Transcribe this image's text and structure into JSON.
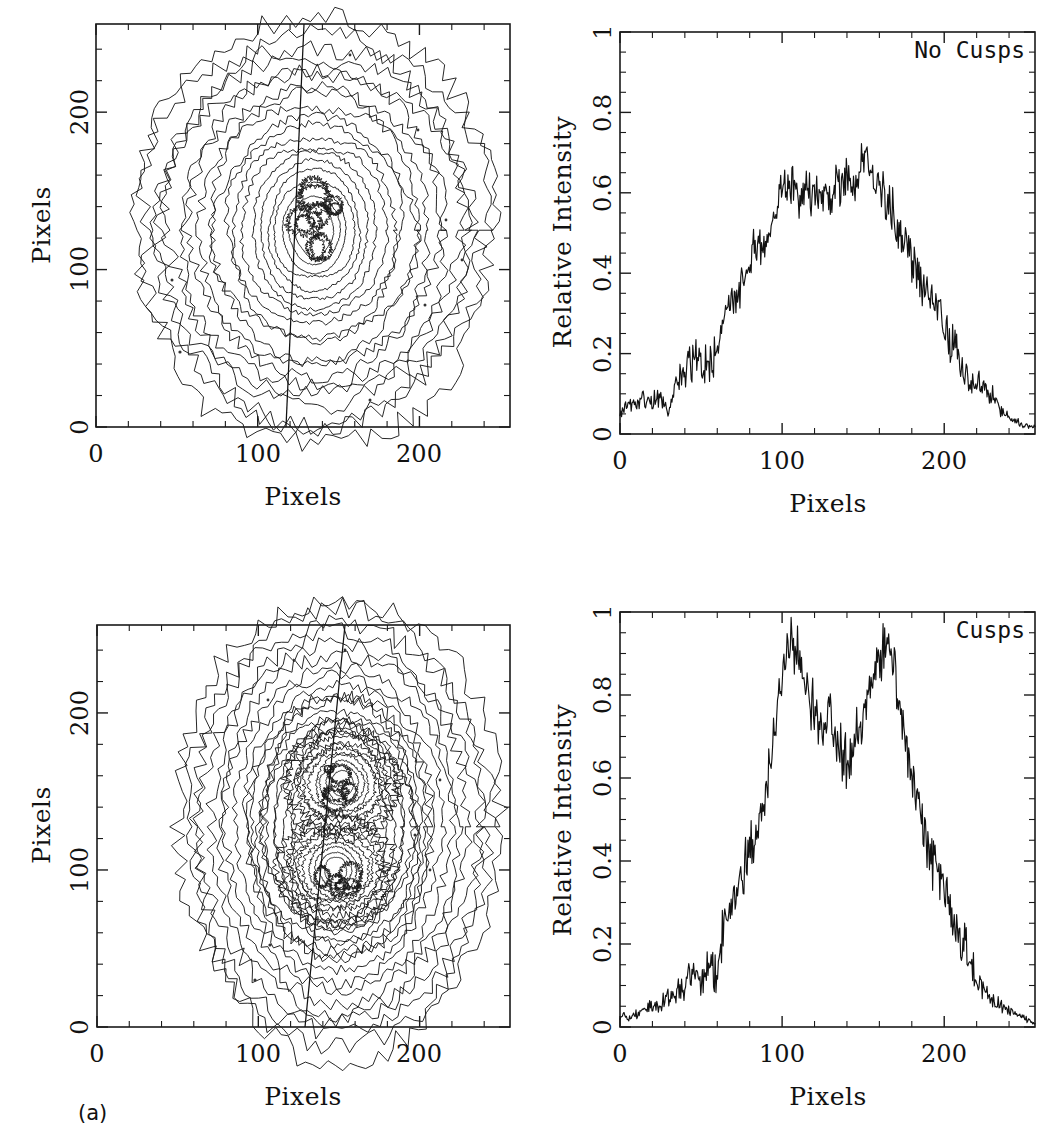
{
  "figure": {
    "panel_label": "(a)",
    "background_color": "#ffffff",
    "line_color": "#111111"
  },
  "panels": {
    "top_left": {
      "name": "contour-no-cusps",
      "xlabel": "Pixels",
      "ylabel": "Pixels",
      "xticks": [
        "0",
        "100",
        "200"
      ],
      "yticks": [
        "0",
        "100",
        "200"
      ],
      "xlim": [
        0,
        256
      ],
      "ylim": [
        0,
        256
      ],
      "annotation": ""
    },
    "top_right": {
      "name": "profile-no-cusps",
      "xlabel": "Pixels",
      "ylabel": "Relative Intensity",
      "xticks": [
        "0",
        "100",
        "200"
      ],
      "yticks": [
        "0",
        "0.2",
        "0.4",
        "0.6",
        "0.8",
        "1"
      ],
      "xlim": [
        0,
        256
      ],
      "ylim": [
        0,
        1
      ],
      "annotation": "No Cusps"
    },
    "bottom_left": {
      "name": "contour-cusps",
      "xlabel": "Pixels",
      "ylabel": "Pixels",
      "xticks": [
        "0",
        "100",
        "200"
      ],
      "yticks": [
        "0",
        "100",
        "200"
      ],
      "xlim": [
        0,
        256
      ],
      "ylim": [
        0,
        256
      ],
      "annotation": ""
    },
    "bottom_right": {
      "name": "profile-cusps",
      "xlabel": "Pixels",
      "ylabel": "Relative Intensity",
      "xticks": [
        "0",
        "100",
        "200"
      ],
      "yticks": [
        "0",
        "0.2",
        "0.4",
        "0.6",
        "0.8",
        "1"
      ],
      "xlim": [
        0,
        256
      ],
      "ylim": [
        0,
        1
      ],
      "annotation": "Cusps"
    }
  },
  "chart_data": [
    {
      "type": "line",
      "name": "no-cusps-profile",
      "title": "No Cusps",
      "xlabel": "Pixels",
      "ylabel": "Relative Intensity",
      "xlim": [
        0,
        256
      ],
      "ylim": [
        0,
        1
      ],
      "grid": false,
      "x": [
        0,
        5,
        10,
        15,
        20,
        25,
        30,
        35,
        40,
        45,
        50,
        55,
        60,
        65,
        70,
        75,
        80,
        85,
        90,
        95,
        100,
        105,
        110,
        115,
        120,
        125,
        130,
        135,
        140,
        145,
        150,
        155,
        160,
        165,
        170,
        175,
        180,
        185,
        190,
        195,
        200,
        205,
        210,
        215,
        220,
        225,
        230,
        235,
        240,
        245,
        250,
        255
      ],
      "values": [
        0.06,
        0.07,
        0.08,
        0.09,
        0.08,
        0.09,
        0.05,
        0.14,
        0.16,
        0.18,
        0.19,
        0.17,
        0.22,
        0.3,
        0.33,
        0.38,
        0.44,
        0.47,
        0.46,
        0.55,
        0.6,
        0.63,
        0.58,
        0.61,
        0.6,
        0.57,
        0.59,
        0.62,
        0.63,
        0.6,
        0.68,
        0.64,
        0.62,
        0.58,
        0.53,
        0.47,
        0.44,
        0.39,
        0.35,
        0.31,
        0.28,
        0.22,
        0.18,
        0.15,
        0.13,
        0.11,
        0.09,
        0.06,
        0.04,
        0.03,
        0.02,
        0.02
      ],
      "noise_amplitude": 0.045,
      "peak_value": 0.73,
      "peak_x": 150,
      "description": "Single broad noisy plateau near 0.60 between x=90 and x=170"
    },
    {
      "type": "line",
      "name": "cusps-profile",
      "title": "Cusps",
      "xlabel": "Pixels",
      "ylabel": "Relative Intensity",
      "xlim": [
        0,
        256
      ],
      "ylim": [
        0,
        1
      ],
      "grid": false,
      "x": [
        0,
        5,
        10,
        15,
        20,
        25,
        30,
        35,
        40,
        45,
        50,
        55,
        60,
        65,
        70,
        75,
        80,
        85,
        90,
        95,
        100,
        105,
        110,
        115,
        120,
        125,
        130,
        135,
        140,
        145,
        150,
        155,
        160,
        165,
        170,
        175,
        180,
        185,
        190,
        195,
        200,
        205,
        210,
        215,
        220,
        225,
        230,
        235,
        240,
        245,
        250,
        255
      ],
      "values": [
        0.03,
        0.02,
        0.03,
        0.04,
        0.05,
        0.06,
        0.07,
        0.08,
        0.1,
        0.13,
        0.11,
        0.14,
        0.13,
        0.28,
        0.3,
        0.36,
        0.42,
        0.48,
        0.58,
        0.72,
        0.85,
        0.95,
        0.9,
        0.82,
        0.76,
        0.72,
        0.78,
        0.68,
        0.63,
        0.7,
        0.74,
        0.82,
        0.88,
        0.93,
        0.85,
        0.72,
        0.6,
        0.55,
        0.42,
        0.38,
        0.33,
        0.26,
        0.2,
        0.16,
        0.12,
        0.09,
        0.06,
        0.05,
        0.04,
        0.03,
        0.02,
        0.01
      ],
      "noise_amplitude": 0.05,
      "peaks": [
        {
          "x": 107,
          "y": 0.96
        },
        {
          "x": 166,
          "y": 0.94
        }
      ],
      "valley": {
        "x": 140,
        "y": 0.6
      },
      "description": "Double-peaked profile with central dip indicating cusps"
    },
    {
      "type": "contour",
      "name": "no-cusps-contours",
      "xlabel": "Pixels",
      "ylabel": "Pixels",
      "xlim": [
        0,
        256
      ],
      "ylim": [
        0,
        256
      ],
      "n_levels": 20,
      "center": [
        135,
        125
      ],
      "description": "Elongated single-core isophote contours, noisy outer levels, near-vertical cut line"
    },
    {
      "type": "contour",
      "name": "cusps-contours",
      "xlabel": "Pixels",
      "ylabel": "Pixels",
      "xlim": [
        0,
        256
      ],
      "ylim": [
        0,
        256
      ],
      "n_levels": 20,
      "centers": [
        [
          148,
          100
        ],
        [
          152,
          155
        ]
      ],
      "description": "Two separated density peaks (cusps) inside common outer isophotes"
    }
  ]
}
